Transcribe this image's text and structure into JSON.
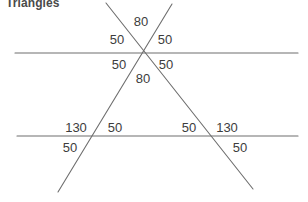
{
  "heading": {
    "text": "Triangles"
  },
  "figure": {
    "name": "triangle-transversal-angles-diagram",
    "stroke_color": "#6e6e6e",
    "text_color": "#3d3d3d",
    "background_color": "#ffffff",
    "stroke_width": 1.1,
    "lines": [
      {
        "name": "upper-horizontal-line",
        "x1": 15,
        "y1": 53,
        "x2": 298,
        "y2": 53
      },
      {
        "name": "lower-horizontal-line",
        "x1": 17,
        "y1": 136,
        "x2": 298,
        "y2": 136
      },
      {
        "name": "left-to-right-diagonal",
        "x1": 106,
        "y1": 3,
        "x2": 253,
        "y2": 189
      },
      {
        "name": "right-to-left-diagonal",
        "x1": 172,
        "y1": 4,
        "x2": 58,
        "y2": 192
      }
    ],
    "vertices": [
      {
        "name": "apex-intersection",
        "x": 146,
        "y": 53
      },
      {
        "name": "left-base-intersection",
        "x": 93,
        "y": 136
      },
      {
        "name": "right-base-intersection",
        "x": 205,
        "y": 136
      }
    ]
  },
  "angle_labels": [
    {
      "name": "angle-apex-top",
      "value": "80",
      "x": 141,
      "y": 21
    },
    {
      "name": "angle-apex-upper-left",
      "value": "50",
      "x": 117,
      "y": 39
    },
    {
      "name": "angle-apex-upper-right",
      "value": "50",
      "x": 165,
      "y": 39
    },
    {
      "name": "angle-apex-lower-left",
      "value": "50",
      "x": 119,
      "y": 64
    },
    {
      "name": "angle-apex-lower-right",
      "value": "50",
      "x": 166,
      "y": 64
    },
    {
      "name": "angle-apex-bottom",
      "value": "80",
      "x": 143,
      "y": 78
    },
    {
      "name": "angle-left-base-upper-left",
      "value": "130",
      "x": 76,
      "y": 127
    },
    {
      "name": "angle-left-base-upper-right",
      "value": "50",
      "x": 115,
      "y": 127
    },
    {
      "name": "angle-left-base-lower-left",
      "value": "50",
      "x": 70,
      "y": 147
    },
    {
      "name": "angle-right-base-upper-left",
      "value": "50",
      "x": 189,
      "y": 127
    },
    {
      "name": "angle-right-base-upper-right",
      "value": "130",
      "x": 227,
      "y": 127
    },
    {
      "name": "angle-right-base-lower-right",
      "value": "50",
      "x": 240,
      "y": 147
    }
  ]
}
